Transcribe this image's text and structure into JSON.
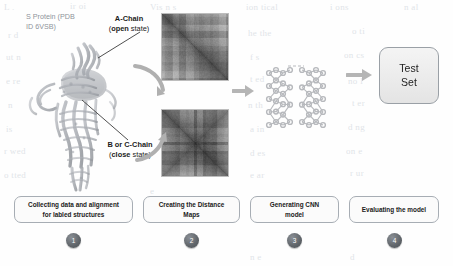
{
  "figure": {
    "protein_label": "S Protein (PDB ID 6VSB)",
    "protein_label_line1": "S Protein (PDB",
    "protein_label_line2": "ID 6VSB)",
    "callouts": [
      {
        "name": "a-chain",
        "line1_bold": "A-Chain",
        "line2_bold": "open",
        "line2_rest": " state)",
        "line2_prefix": "("
      },
      {
        "name": "bc-chain",
        "line1_bold": "B or C-Chain",
        "line2_bold": "close",
        "line2_rest": " state)",
        "line2_prefix": "("
      }
    ],
    "distance_maps": [
      {
        "name": "distance-map-open",
        "alt": "distance map A-chain open state"
      },
      {
        "name": "distance-map-close",
        "alt": "distance map B or C chain close state"
      }
    ],
    "cnn_label": "cnn-network-graphic",
    "test_set": {
      "line1": "Test",
      "line2": "Set"
    }
  },
  "steps": [
    {
      "num": "1",
      "line1": "Collecting data and alignment",
      "line2": "for labled structures"
    },
    {
      "num": "2",
      "line1": "Creating the Distance",
      "line2": "Maps"
    },
    {
      "num": "3",
      "line1": "Generating CNN",
      "line2": "model"
    },
    {
      "num": "4",
      "line1": "Evaluating the model",
      "line2": ""
    }
  ],
  "background_text": [
    {
      "t": "L .",
      "x": 4,
      "y": 2,
      "s": 9
    },
    {
      "t": "ir  oi",
      "x": 70,
      "y": 1,
      "s": 9
    },
    {
      "t": "Vis n  s",
      "x": 150,
      "y": 2,
      "s": 9
    },
    {
      "t": "ion  tical",
      "x": 246,
      "y": 2,
      "s": 9
    },
    {
      "t": "i  ons",
      "x": 330,
      "y": 2,
      "s": 9
    },
    {
      "t": "n   al",
      "x": 404,
      "y": 2,
      "s": 9
    },
    {
      "t": "r   d",
      "x": 8,
      "y": 30,
      "s": 9
    },
    {
      "t": "he  the",
      "x": 248,
      "y": 28,
      "s": 9
    },
    {
      "t": "o  ti",
      "x": 352,
      "y": 26,
      "s": 9
    },
    {
      "t": "ut   n",
      "x": 6,
      "y": 52,
      "s": 9
    },
    {
      "t": "f   s",
      "x": 250,
      "y": 52,
      "s": 9
    },
    {
      "t": "on   cs",
      "x": 344,
      "y": 50,
      "s": 9
    },
    {
      "t": "e  re",
      "x": 6,
      "y": 76,
      "s": 9
    },
    {
      "t": "t  ed",
      "x": 250,
      "y": 74,
      "s": 9
    },
    {
      "t": "no   l",
      "x": 348,
      "y": 76,
      "s": 9
    },
    {
      "t": "n",
      "x": 8,
      "y": 100,
      "s": 9
    },
    {
      "t": "n  th",
      "x": 248,
      "y": 100,
      "s": 9
    },
    {
      "t": "t  er",
      "x": 352,
      "y": 98,
      "s": 9
    },
    {
      "t": "is",
      "x": 6,
      "y": 124,
      "s": 9
    },
    {
      "t": "a  in",
      "x": 250,
      "y": 124,
      "s": 9
    },
    {
      "t": "d  ng",
      "x": 348,
      "y": 122,
      "s": 9
    },
    {
      "t": "r  wed",
      "x": 4,
      "y": 146,
      "s": 9
    },
    {
      "t": "d  es",
      "x": 250,
      "y": 148,
      "s": 9
    },
    {
      "t": "on   e",
      "x": 346,
      "y": 146,
      "s": 9
    },
    {
      "t": "o  tted",
      "x": 4,
      "y": 170,
      "s": 9
    },
    {
      "t": "e   ar",
      "x": 250,
      "y": 170,
      "s": 9
    },
    {
      "t": "r  ur",
      "x": 350,
      "y": 168,
      "s": 9
    },
    {
      "t": "e",
      "x": 150,
      "y": 186,
      "s": 9
    },
    {
      "t": "n  e",
      "x": 250,
      "y": 252,
      "s": 9
    },
    {
      "t": "d",
      "x": 350,
      "y": 252,
      "s": 9
    }
  ]
}
